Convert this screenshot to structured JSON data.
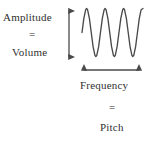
{
  "diagram": {
    "title_text_left": "Amplitude",
    "equals_left": "=",
    "subtitle_text_left": "Volume",
    "title_text_bottom": "Frequency",
    "equals_bottom": "=",
    "subtitle_text_bottom": "Pitch",
    "background_color": "#ffffff",
    "ink_color": "#2f2f2f",
    "stroke_color": "#4a4a4a"
  },
  "chart_data": {
    "type": "line",
    "title": "",
    "xlabel": "Frequency = Pitch",
    "ylabel": "Amplitude = Volume",
    "grid": false,
    "legend": "none",
    "xlim": [
      0,
      3.3
    ],
    "ylim": [
      -1,
      1
    ],
    "cycles": 3.3,
    "amplitude": 1,
    "peaks_x": [
      0.25,
      1.25,
      2.25
    ],
    "troughs_x": [
      0.75,
      1.75,
      2.75
    ],
    "series": [
      {
        "name": "sound wave",
        "x": [
          0,
          0.1,
          0.2,
          0.25,
          0.3,
          0.4,
          0.5,
          0.6,
          0.7,
          0.75,
          0.8,
          0.9,
          1.0,
          1.1,
          1.2,
          1.25,
          1.3,
          1.4,
          1.5,
          1.6,
          1.7,
          1.75,
          1.8,
          1.9,
          2.0,
          2.1,
          2.2,
          2.25,
          2.3,
          2.4,
          2.5,
          2.6,
          2.7,
          2.75,
          2.8,
          2.9,
          3.0,
          3.1,
          3.2,
          3.3
        ],
        "values": [
          0,
          0.59,
          0.95,
          1,
          0.95,
          0.59,
          0,
          -0.59,
          -0.95,
          -1,
          -0.95,
          -0.59,
          0,
          0.59,
          0.95,
          1,
          0.95,
          0.59,
          0,
          -0.59,
          -0.95,
          -1,
          -0.95,
          -0.59,
          0,
          0.59,
          0.95,
          1,
          0.95,
          0.59,
          0,
          -0.59,
          -0.95,
          -1,
          -0.95,
          -0.59,
          0,
          0.59,
          0.95,
          1
        ]
      }
    ]
  },
  "annotations": {
    "vertical_arrow": "amplitude-axis-double-arrow",
    "horizontal_arrow": "frequency-axis-double-arrow"
  }
}
